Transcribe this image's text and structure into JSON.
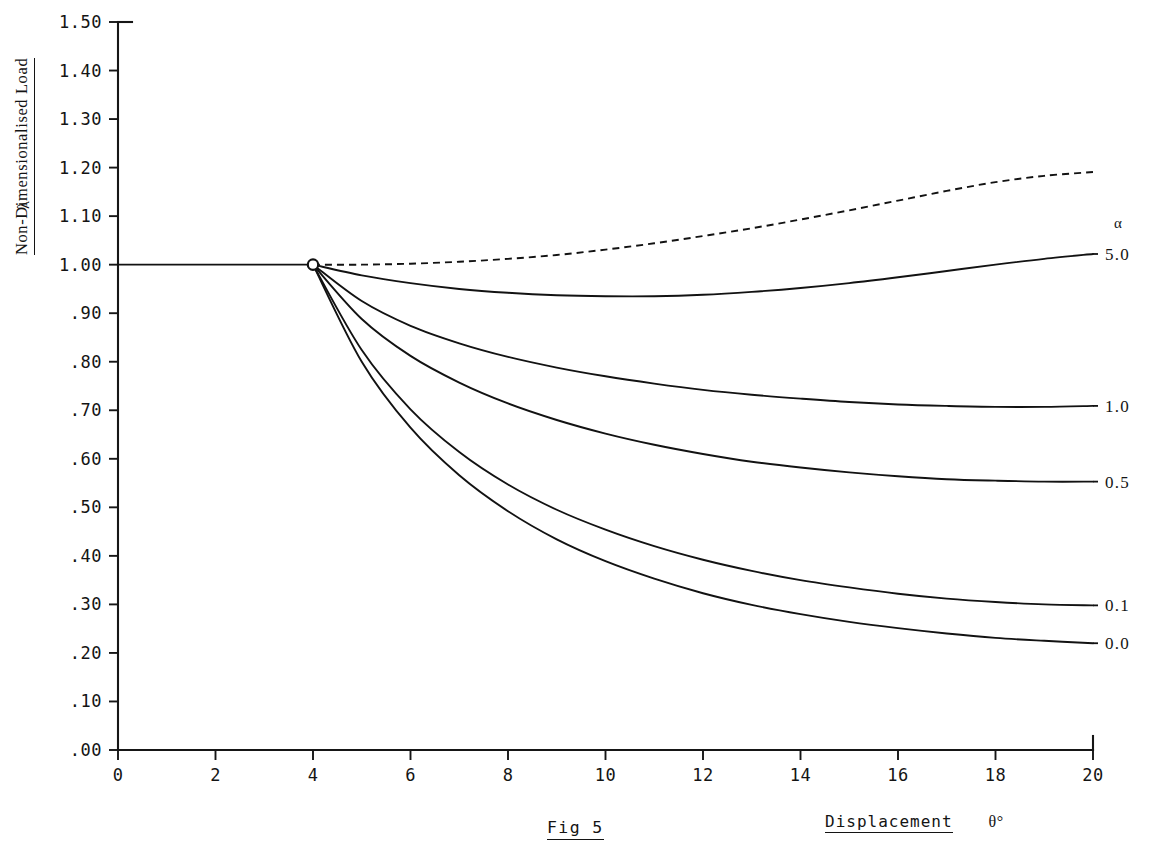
{
  "figure": {
    "caption": "Fig 5",
    "y_axis_title": "Non-Dimensionalised Load",
    "y_axis_symbol": "λ",
    "x_axis_title": "Displacement",
    "x_axis_symbol": "θ°",
    "legend_header": "α"
  },
  "chart_data": {
    "type": "line",
    "title": "Fig 5",
    "xlabel": "Displacement  θ°",
    "ylabel": "Non-Dimensionalised Load  λ",
    "xlim": [
      0,
      20
    ],
    "ylim": [
      0.0,
      1.5
    ],
    "grid": false,
    "legend_position": "right-of-plot",
    "legend_header": "α",
    "xticks": [
      "0",
      "2",
      "4",
      "6",
      "8",
      "10",
      "12",
      "14",
      "16",
      "18",
      "20"
    ],
    "xtick_values": [
      0,
      2,
      4,
      6,
      8,
      10,
      12,
      14,
      16,
      18,
      20
    ],
    "yticks": [
      ".00",
      ".10",
      ".20",
      ".30",
      ".40",
      ".50",
      ".60",
      ".70",
      ".80",
      ".90",
      "1.00",
      "1.10",
      "1.20",
      "1.30",
      "1.40",
      "1.50"
    ],
    "ytick_values": [
      0.0,
      0.1,
      0.2,
      0.3,
      0.4,
      0.5,
      0.6,
      0.7,
      0.8,
      0.9,
      1.0,
      1.1,
      1.2,
      1.3,
      1.4,
      1.5
    ],
    "annotations": [
      {
        "name": "bifurcation-point",
        "x": 4.0,
        "y": 1.0,
        "marker": "open-circle"
      }
    ],
    "series": [
      {
        "name": "fundamental-path",
        "label": "",
        "style": "solid",
        "x": [
          0.0,
          1.0,
          2.0,
          3.0,
          4.0
        ],
        "values": [
          1.0,
          1.0,
          1.0,
          1.0,
          1.0
        ]
      },
      {
        "name": "unstable-dashed-branch",
        "label": "",
        "style": "dashed",
        "x": [
          4.0,
          5.0,
          6.0,
          7.0,
          8.0,
          9.0,
          10.0,
          11.0,
          12.0,
          13.0,
          14.0,
          15.0,
          16.0,
          17.0,
          18.0,
          19.0,
          20.0
        ],
        "values": [
          1.0,
          1.0,
          1.002,
          1.006,
          1.012,
          1.02,
          1.031,
          1.044,
          1.059,
          1.075,
          1.093,
          1.112,
          1.132,
          1.152,
          1.17,
          1.183,
          1.191
        ]
      },
      {
        "name": "alpha-5.0",
        "label": "5.0",
        "style": "solid",
        "x": [
          4.0,
          5.0,
          6.0,
          7.0,
          8.0,
          9.0,
          10.0,
          11.0,
          12.0,
          13.0,
          14.0,
          15.0,
          16.0,
          17.0,
          18.0,
          19.0,
          20.0
        ],
        "values": [
          1.0,
          0.978,
          0.962,
          0.95,
          0.942,
          0.937,
          0.935,
          0.935,
          0.938,
          0.944,
          0.952,
          0.962,
          0.974,
          0.987,
          1.0,
          1.012,
          1.022
        ]
      },
      {
        "name": "alpha-1.0",
        "label": "1.0",
        "style": "solid",
        "x": [
          4.0,
          5.0,
          6.0,
          7.0,
          8.0,
          9.0,
          10.0,
          11.0,
          12.0,
          13.0,
          14.0,
          15.0,
          16.0,
          17.0,
          18.0,
          19.0,
          20.0
        ],
        "values": [
          1.0,
          0.925,
          0.874,
          0.838,
          0.81,
          0.788,
          0.77,
          0.755,
          0.742,
          0.732,
          0.724,
          0.717,
          0.712,
          0.709,
          0.707,
          0.707,
          0.709
        ]
      },
      {
        "name": "alpha-0.5",
        "label": "0.5",
        "style": "solid",
        "x": [
          4.0,
          5.0,
          6.0,
          7.0,
          8.0,
          9.0,
          10.0,
          11.0,
          12.0,
          13.0,
          14.0,
          15.0,
          16.0,
          17.0,
          18.0,
          19.0,
          20.0
        ],
        "values": [
          1.0,
          0.888,
          0.812,
          0.757,
          0.714,
          0.68,
          0.652,
          0.629,
          0.61,
          0.594,
          0.582,
          0.572,
          0.564,
          0.558,
          0.555,
          0.553,
          0.553
        ]
      },
      {
        "name": "alpha-0.1",
        "label": "0.1",
        "style": "solid",
        "x": [
          4.0,
          5.0,
          6.0,
          7.0,
          8.0,
          9.0,
          10.0,
          11.0,
          12.0,
          13.0,
          14.0,
          15.0,
          16.0,
          17.0,
          18.0,
          19.0,
          20.0
        ],
        "values": [
          1.0,
          0.824,
          0.702,
          0.614,
          0.547,
          0.495,
          0.454,
          0.42,
          0.392,
          0.369,
          0.35,
          0.335,
          0.322,
          0.312,
          0.305,
          0.3,
          0.298
        ]
      },
      {
        "name": "alpha-0.0",
        "label": "0.0",
        "style": "solid",
        "x": [
          4.0,
          5.0,
          6.0,
          7.0,
          8.0,
          9.0,
          10.0,
          11.0,
          12.0,
          13.0,
          14.0,
          15.0,
          16.0,
          17.0,
          18.0,
          19.0,
          20.0
        ],
        "values": [
          1.0,
          0.8,
          0.664,
          0.566,
          0.492,
          0.434,
          0.389,
          0.353,
          0.323,
          0.299,
          0.28,
          0.264,
          0.251,
          0.24,
          0.231,
          0.225,
          0.22
        ]
      }
    ]
  }
}
